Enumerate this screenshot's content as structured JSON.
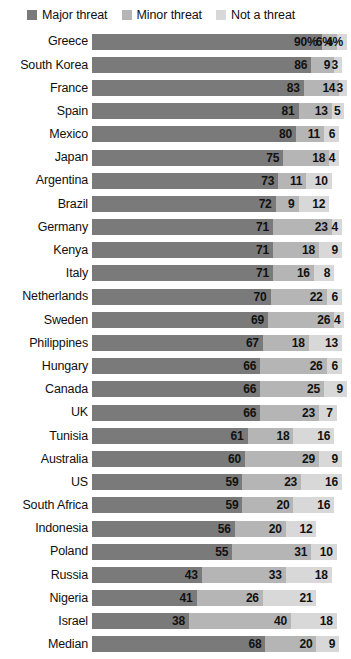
{
  "legend": {
    "items": [
      {
        "label": "Major threat",
        "color": "#7a7a7a",
        "key": "major"
      },
      {
        "label": "Minor threat",
        "color": "#b5b5b5",
        "key": "minor"
      },
      {
        "label": "Not a threat",
        "color": "#d8d8d8",
        "key": "none"
      }
    ]
  },
  "colors": {
    "major": "#7a7a7a",
    "minor": "#b5b5b5",
    "none": "#d8d8d8",
    "text": "#111111",
    "background": "#ffffff"
  },
  "chart_data": {
    "type": "bar",
    "title": "",
    "subtitle": "",
    "xlabel": "",
    "ylabel": "",
    "stacked": true,
    "orientation": "horizontal",
    "grid": false,
    "legend_position": "top",
    "xlim": [
      0,
      100
    ],
    "value_suffix_first_row": "%",
    "categories": [
      "Greece",
      "South Korea",
      "France",
      "Spain",
      "Mexico",
      "Japan",
      "Argentina",
      "Brazil",
      "Germany",
      "Kenya",
      "Italy",
      "Netherlands",
      "Sweden",
      "Philippines",
      "Hungary",
      "Canada",
      "UK",
      "Tunisia",
      "Australia",
      "US",
      "South Africa",
      "Indonesia",
      "Poland",
      "Russia",
      "Nigeria",
      "Israel",
      "Median"
    ],
    "series": [
      {
        "name": "Major threat",
        "key": "major",
        "color": "#7a7a7a",
        "values": [
          90,
          86,
          83,
          81,
          80,
          75,
          73,
          72,
          71,
          71,
          71,
          70,
          69,
          67,
          66,
          66,
          66,
          61,
          60,
          59,
          59,
          56,
          55,
          43,
          41,
          38,
          68
        ]
      },
      {
        "name": "Minor threat",
        "key": "minor",
        "color": "#b5b5b5",
        "values": [
          6,
          9,
          14,
          13,
          11,
          18,
          11,
          9,
          23,
          18,
          16,
          22,
          26,
          18,
          26,
          25,
          23,
          18,
          29,
          23,
          20,
          20,
          31,
          33,
          26,
          40,
          20
        ]
      },
      {
        "name": "Not a threat",
        "key": "none",
        "color": "#d8d8d8",
        "values": [
          4,
          3,
          3,
          5,
          6,
          4,
          10,
          12,
          4,
          9,
          8,
          6,
          4,
          13,
          6,
          9,
          7,
          16,
          9,
          16,
          16,
          12,
          10,
          18,
          21,
          18,
          9
        ]
      }
    ],
    "labels": [
      {
        "category": "Greece",
        "major": "90%",
        "minor": "6%",
        "none": "4%"
      },
      {
        "category": "South Korea",
        "major": "86",
        "minor": "9",
        "none": "3"
      },
      {
        "category": "France",
        "major": "83",
        "minor": "14",
        "none": "3"
      },
      {
        "category": "Spain",
        "major": "81",
        "minor": "13",
        "none": "5"
      },
      {
        "category": "Mexico",
        "major": "80",
        "minor": "11",
        "none": "6"
      },
      {
        "category": "Japan",
        "major": "75",
        "minor": "18",
        "none": "4"
      },
      {
        "category": "Argentina",
        "major": "73",
        "minor": "11",
        "none": "10"
      },
      {
        "category": "Brazil",
        "major": "72",
        "minor": "9",
        "none": "12"
      },
      {
        "category": "Germany",
        "major": "71",
        "minor": "23",
        "none": "4"
      },
      {
        "category": "Kenya",
        "major": "71",
        "minor": "18",
        "none": "9"
      },
      {
        "category": "Italy",
        "major": "71",
        "minor": "16",
        "none": "8"
      },
      {
        "category": "Netherlands",
        "major": "70",
        "minor": "22",
        "none": "6"
      },
      {
        "category": "Sweden",
        "major": "69",
        "minor": "26",
        "none": "4"
      },
      {
        "category": "Philippines",
        "major": "67",
        "minor": "18",
        "none": "13"
      },
      {
        "category": "Hungary",
        "major": "66",
        "minor": "26",
        "none": "6"
      },
      {
        "category": "Canada",
        "major": "66",
        "minor": "25",
        "none": "9"
      },
      {
        "category": "UK",
        "major": "66",
        "minor": "23",
        "none": "7"
      },
      {
        "category": "Tunisia",
        "major": "61",
        "minor": "18",
        "none": "16"
      },
      {
        "category": "Australia",
        "major": "60",
        "minor": "29",
        "none": "9"
      },
      {
        "category": "US",
        "major": "59",
        "minor": "23",
        "none": "16"
      },
      {
        "category": "South Africa",
        "major": "59",
        "minor": "20",
        "none": "16"
      },
      {
        "category": "Indonesia",
        "major": "56",
        "minor": "20",
        "none": "12"
      },
      {
        "category": "Poland",
        "major": "55",
        "minor": "31",
        "none": "10"
      },
      {
        "category": "Russia",
        "major": "43",
        "minor": "33",
        "none": "18"
      },
      {
        "category": "Nigeria",
        "major": "41",
        "minor": "26",
        "none": "21"
      },
      {
        "category": "Israel",
        "major": "38",
        "minor": "40",
        "none": "18"
      },
      {
        "category": "Median",
        "major": "68",
        "minor": "20",
        "none": "9"
      }
    ]
  }
}
